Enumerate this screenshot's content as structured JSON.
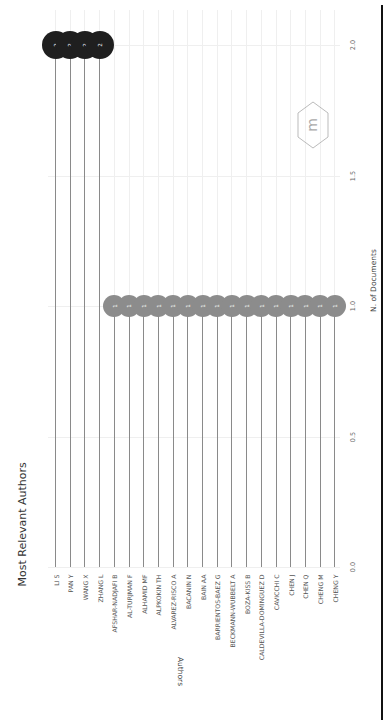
{
  "chart_data": {
    "type": "lollipop",
    "orientation": "rotated 90 degrees counter-clockwise",
    "title": "Most Relevant Authors",
    "xlabel": "N. of Documents",
    "ylabel": "Authors",
    "xlim": [
      0,
      2
    ],
    "xticks": [
      "0.0",
      "0.5",
      "1.0",
      "1.5",
      "2.0"
    ],
    "grid": true,
    "categories": [
      "LI S",
      "PAN Y",
      "WANG X",
      "ZHANG L",
      "AFSHAR-NADJAFI B",
      "AL-TURJMAN F",
      "ALHAMID MF",
      "ALPKOKIN TH",
      "ALVAREZ-RISCO A",
      "BACANIN N",
      "BAIN AA",
      "BARRIENTOS-BAEZ G",
      "BECKMANN-WUBBELT A",
      "BOZA-KISS B",
      "CALDEVILLA-DOMINGUEZ D",
      "CAVICCHI C",
      "CHEN J",
      "CHEN Q",
      "CHENG M",
      "CHENG Y"
    ],
    "values": [
      2,
      2,
      2,
      2,
      1,
      1,
      1,
      1,
      1,
      1,
      1,
      1,
      1,
      1,
      1,
      1,
      1,
      1,
      1,
      1
    ],
    "colors": {
      "high": "#1f1f1f",
      "low": "#8c8c8c",
      "stem": "#8a8a8a"
    }
  },
  "labels": {
    "title": "Most Relevant Authors",
    "xlabel": "N. of Documents",
    "ylabel": "Authors"
  },
  "logo": {
    "name": "bibliometrix-logo"
  }
}
